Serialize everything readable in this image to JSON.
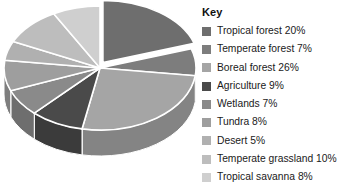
{
  "legend": {
    "title": "Key",
    "position": "right"
  },
  "chart_data": {
    "type": "pie",
    "title": "",
    "subtitle": "",
    "xlabel": "",
    "ylabel": "",
    "style": "3d-exploded",
    "exploded_slice": "Tropical forest",
    "grid": false,
    "legend_position": "right",
    "categories": [
      "Tropical forest",
      "Temperate forest",
      "Boreal forest",
      "Agriculture",
      "Wetlands",
      "Tundra",
      "Desert",
      "Temperate grassland",
      "Tropical savanna"
    ],
    "values": [
      20,
      7,
      26,
      9,
      7,
      8,
      5,
      10,
      8
    ],
    "units": "%",
    "colors": [
      "#6e6e6e",
      "#7d7d7d",
      "#a5a5a5",
      "#4a4a4a",
      "#8a8a8a",
      "#9e9e9e",
      "#b0b0b0",
      "#bdbdbd",
      "#cfcfcf"
    ],
    "items": [
      {
        "label": "Tropical forest 20%",
        "name": "Tropical forest",
        "value": 20,
        "color": "#6e6e6e"
      },
      {
        "label": "Temperate forest 7%",
        "name": "Temperate forest",
        "value": 7,
        "color": "#7d7d7d"
      },
      {
        "label": "Boreal forest 26%",
        "name": "Boreal forest",
        "value": 26,
        "color": "#a5a5a5"
      },
      {
        "label": "Agriculture 9%",
        "name": "Agriculture",
        "value": 9,
        "color": "#4a4a4a"
      },
      {
        "label": "Wetlands 7%",
        "name": "Wetlands",
        "value": 7,
        "color": "#8a8a8a"
      },
      {
        "label": "Tundra 8%",
        "name": "Tundra",
        "value": 8,
        "color": "#9e9e9e"
      },
      {
        "label": "Desert 5%",
        "name": "Desert",
        "value": 5,
        "color": "#b0b0b0"
      },
      {
        "label": "Temperate grassland 10%",
        "name": "Temperate grassland",
        "value": 10,
        "color": "#bdbdbd"
      },
      {
        "label": "Tropical savanna 8%",
        "name": "Tropical savanna",
        "value": 8,
        "color": "#cfcfcf"
      }
    ]
  }
}
